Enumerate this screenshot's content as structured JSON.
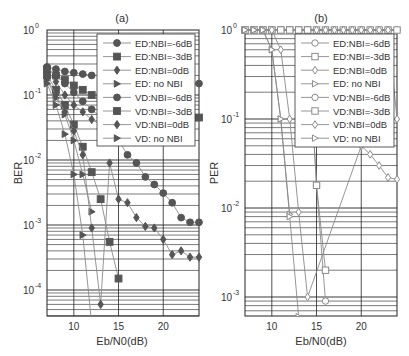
{
  "chart_data": [
    {
      "type": "line",
      "title": "(a)",
      "xlabel": "Eb/N0(dB)",
      "ylabel": "BER",
      "xlim": [
        7,
        24
      ],
      "ylim": [
        3e-05,
        1
      ],
      "yscale": "log",
      "xticks": [
        10,
        15,
        20
      ],
      "yticks": [
        "10^0",
        "10^-1",
        "10^-2",
        "10^-3",
        "10^-4"
      ],
      "grid": true,
      "legend_position": "upper right",
      "series": [
        {
          "name": "ED:NBI=-6dB",
          "marker": "circle",
          "filled": true,
          "x": [
            7,
            8,
            9,
            10,
            11,
            12
          ],
          "values": [
            0.27,
            0.25,
            0.23,
            0.22,
            0.21,
            0.2
          ]
        },
        {
          "name": "ED:NBI=-3dB",
          "marker": "square",
          "filled": true,
          "x": [
            7,
            8,
            9,
            10,
            11,
            12,
            13
          ],
          "values": [
            0.25,
            0.2,
            0.17,
            0.14,
            0.12,
            0.1,
            0.095
          ]
        },
        {
          "name": "ED:NBI=0dB",
          "marker": "diamond",
          "filled": true,
          "x": [
            7,
            8,
            9,
            10,
            11,
            12,
            13
          ],
          "values": [
            0.22,
            0.16,
            0.1,
            0.07,
            0.055,
            0.042,
            0.035
          ]
        },
        {
          "name": "ED: no NBI",
          "marker": "triangle-right",
          "filled": true,
          "x": [
            7,
            8,
            9,
            10,
            11,
            12
          ],
          "values": [
            0.17,
            0.09,
            0.05,
            0.02,
            0.006,
            0.0016
          ]
        },
        {
          "name": "VD:NBI=-6dB",
          "marker": "circle",
          "filled": true,
          "x": [
            7,
            8,
            9,
            10,
            11,
            12,
            13,
            14,
            15,
            16,
            17,
            18,
            19,
            20,
            21,
            22,
            23,
            24
          ],
          "values": [
            0.26,
            0.2,
            0.15,
            0.11,
            0.08,
            0.06,
            0.045,
            0.032,
            0.02,
            0.012,
            0.009,
            0.0055,
            0.0042,
            0.0031,
            0.0022,
            0.0013,
            0.0011,
            0.0011
          ]
        },
        {
          "name": "VD:NBI=-3dB",
          "marker": "square",
          "filled": true,
          "x": [
            7,
            8,
            9,
            10,
            11,
            12,
            13,
            14,
            15
          ],
          "values": [
            0.2,
            0.12,
            0.07,
            0.035,
            0.016,
            0.0065,
            0.0025,
            0.00055,
            0.00015
          ]
        },
        {
          "name": "VD:NBI=0dB",
          "marker": "diamond",
          "filled": true,
          "x": [
            7,
            8,
            9,
            10,
            11,
            12,
            13,
            14,
            15,
            16,
            17,
            18,
            19,
            20,
            21,
            22,
            23,
            24
          ],
          "values": [
            0.18,
            0.1,
            0.055,
            0.028,
            0.012,
            0.0009,
            6e-05,
            0.009,
            0.0025,
            0.0022,
            0.0013,
            0.00095,
            0.0009,
            0.0006,
            0.00035,
            0.0004,
            0.00032,
            0.00032
          ]
        },
        {
          "name": "VD: no NBI",
          "marker": "triangle-right",
          "filled": true,
          "x": [
            7,
            8,
            9,
            10,
            11,
            12
          ],
          "values": [
            0.15,
            0.07,
            0.025,
            0.006,
            0.0007,
            3e-05
          ]
        }
      ],
      "extra_points": {
        "right_edge_circle_x24": 0.15,
        "right_edge_square_x24": 0.045
      }
    },
    {
      "type": "line",
      "title": "(b)",
      "xlabel": "Eb/N0(dB)",
      "ylabel": "PER",
      "xlim": [
        7,
        24
      ],
      "ylim": [
        0.0006,
        1
      ],
      "yscale": "log",
      "xticks": [
        10,
        15,
        20
      ],
      "yticks": [
        "10^0",
        "10^-1",
        "10^-2",
        "10^-3"
      ],
      "grid": true,
      "legend_position": "upper right",
      "series": [
        {
          "name": "ED:NBI=-6dB",
          "marker": "circle",
          "filled": false,
          "x": [
            7,
            8,
            9,
            10,
            11,
            12,
            13,
            14,
            15,
            16,
            17,
            18,
            19,
            20,
            21,
            22,
            23,
            24
          ],
          "values": [
            1,
            1,
            1,
            1,
            1,
            1,
            1,
            1,
            1,
            1,
            1,
            1,
            1,
            1,
            1,
            1,
            1,
            1
          ]
        },
        {
          "name": "ED:NBI=-3dB",
          "marker": "square",
          "filled": false,
          "x": [
            7,
            8,
            9,
            10,
            11,
            12,
            13,
            14,
            15,
            16,
            17,
            18,
            19,
            20,
            21,
            22,
            23,
            24
          ],
          "values": [
            1,
            1,
            1,
            1,
            1,
            1,
            1,
            1,
            1,
            1,
            1,
            1,
            1,
            1,
            1,
            1,
            1,
            1
          ]
        },
        {
          "name": "ED:NBI=0dB",
          "marker": "diamond",
          "filled": false,
          "x": [
            7,
            8,
            9,
            10,
            11,
            12,
            13,
            14,
            15,
            16,
            17,
            18,
            19,
            20,
            21,
            22,
            23,
            24
          ],
          "values": [
            1,
            1,
            1,
            1,
            1,
            1,
            1,
            1,
            1,
            1,
            1,
            1,
            1,
            1,
            1,
            1,
            1,
            0.1
          ]
        },
        {
          "name": "ED: no NBI",
          "marker": "triangle-right",
          "filled": false,
          "x": [
            7,
            8,
            9,
            10,
            11,
            12
          ],
          "values": [
            1,
            1,
            1,
            0.6,
            0.1,
            0.0085
          ]
        },
        {
          "name": "VD:NBI=-6dB",
          "marker": "circle",
          "filled": false,
          "x": [
            7,
            8,
            9,
            10,
            11,
            12,
            13,
            14,
            15,
            16
          ],
          "values": [
            1,
            1,
            1,
            1,
            1,
            1,
            1,
            1,
            0.018,
            0.0009
          ]
        },
        {
          "name": "VD:NBI=-3dB",
          "marker": "square",
          "filled": false,
          "x": [
            7,
            8,
            9,
            10,
            11,
            12,
            13,
            14,
            15,
            16
          ],
          "values": [
            1,
            1,
            1,
            1,
            1,
            1,
            1,
            1,
            0.018,
            0.002
          ]
        },
        {
          "name": "VD:NBI=0dB",
          "marker": "diamond",
          "filled": false,
          "x": [
            7,
            8,
            9,
            10,
            11,
            12,
            13,
            14,
            20,
            21,
            22,
            23,
            24
          ],
          "values": [
            1,
            1,
            1,
            1,
            0.6,
            0.1,
            0.009,
            0.001,
            0.05,
            0.04,
            0.03,
            0.022,
            0.021
          ]
        },
        {
          "name": "VD: no NBI",
          "marker": "triangle-right",
          "filled": false,
          "x": [
            7,
            8,
            9,
            10,
            11,
            12,
            13
          ],
          "values": [
            1,
            1,
            1,
            0.6,
            0.1,
            0.008,
            0.0006
          ]
        }
      ]
    }
  ],
  "panels": [
    {
      "title": "(a)",
      "ylabel": "BER",
      "xlabel": "Eb/N0(dB)",
      "xticks": [
        "10",
        "15",
        "20"
      ],
      "yticks": [
        {
          "base": "10",
          "exp": "0"
        },
        {
          "base": "10",
          "exp": "-1"
        },
        {
          "base": "10",
          "exp": "-2"
        },
        {
          "base": "10",
          "exp": "-3"
        },
        {
          "base": "10",
          "exp": "-4"
        }
      ]
    },
    {
      "title": "(b)",
      "ylabel": "PER",
      "xlabel": "Eb/N0(dB)",
      "xticks": [
        "10",
        "15",
        "20"
      ],
      "yticks": [
        {
          "base": "10",
          "exp": "0"
        },
        {
          "base": "10",
          "exp": "-1"
        },
        {
          "base": "10",
          "exp": "-2"
        },
        {
          "base": "10",
          "exp": "-3"
        }
      ]
    }
  ],
  "legend": [
    "ED:NBI=-6dB",
    "ED:NBI=-3dB",
    "ED:NBI=0dB",
    "ED: no NBI",
    "VD:NBI=-6dB",
    "VD:NBI=-3dB",
    "VD:NBI=0dB",
    "VD: no NBI"
  ],
  "colors": {
    "line": "#8a8a8a",
    "marker_a": "#555555",
    "marker_b": "#8a8a8a",
    "grid": "#222222",
    "text": "#333333"
  }
}
